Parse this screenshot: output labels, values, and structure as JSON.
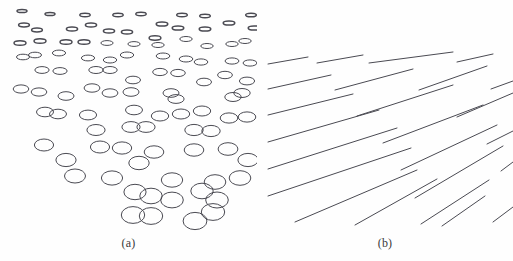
{
  "figure": {
    "background_color": "#fefefe",
    "stroke_color": "#4a4a52",
    "caption_color": "#3a3a3a",
    "width": 513,
    "height": 261
  },
  "panels": [
    {
      "id": "a",
      "caption": "(a)",
      "kind": "ellipse-texture-gradient",
      "description": "Field of small ellipses whose vertical compression decreases from top to bottom, producing a texture depth gradient."
    },
    {
      "id": "b",
      "caption": "(b)",
      "kind": "line-orientation-gradient",
      "description": "Field of parallel straight line segments whose slope steepens from upper-left to lower-right."
    }
  ],
  "chart_data": {
    "type": "scatter",
    "title": "",
    "xlabel": "",
    "ylabel": "",
    "panel_a": {
      "type": "scatter",
      "marker": "ellipse-outline",
      "xlim": [
        0,
        257
      ],
      "ylim": [
        0,
        235
      ],
      "grid": false,
      "legend": null,
      "note": "x, y are pixel centers; rx, ry are ellipse radii in px; flatness decreases with y",
      "fields": [
        "x",
        "y",
        "rx",
        "ry"
      ],
      "points": [
        [
          22,
          11,
          5.0,
          1.6
        ],
        [
          50,
          14,
          5.0,
          1.6
        ],
        [
          85,
          15,
          5.2,
          1.7
        ],
        [
          118,
          15,
          5.2,
          1.7
        ],
        [
          141,
          14,
          5.2,
          1.7
        ],
        [
          182,
          15,
          5.3,
          1.7
        ],
        [
          205,
          16,
          5.3,
          1.7
        ],
        [
          251,
          15,
          5.3,
          1.8
        ],
        [
          24,
          25,
          5.4,
          1.9
        ],
        [
          37,
          30,
          5.4,
          1.9
        ],
        [
          72,
          29,
          5.6,
          2.0
        ],
        [
          91,
          25,
          5.6,
          2.0
        ],
        [
          109,
          31,
          5.6,
          2.0
        ],
        [
          127,
          32,
          5.6,
          2.0
        ],
        [
          162,
          24,
          5.8,
          2.1
        ],
        [
          178,
          28,
          5.8,
          2.1
        ],
        [
          205,
          29,
          5.8,
          2.1
        ],
        [
          229,
          23,
          5.8,
          2.1
        ],
        [
          254,
          28,
          5.8,
          2.1
        ],
        [
          40,
          41,
          6.0,
          2.3
        ],
        [
          66,
          42,
          6.0,
          2.3
        ],
        [
          84,
          42,
          6.0,
          2.3
        ],
        [
          107,
          43,
          6.1,
          2.4
        ],
        [
          134,
          44,
          6.1,
          2.4
        ],
        [
          158,
          45,
          6.2,
          2.5
        ],
        [
          186,
          39,
          6.2,
          2.5
        ],
        [
          207,
          46,
          6.2,
          2.5
        ],
        [
          232,
          44,
          6.2,
          2.5
        ],
        [
          245,
          41,
          6.2,
          2.5
        ],
        [
          23,
          57,
          6.5,
          2.8
        ],
        [
          35,
          55,
          6.5,
          2.8
        ],
        [
          59,
          53,
          6.6,
          2.9
        ],
        [
          88,
          58,
          6.6,
          2.9
        ],
        [
          110,
          60,
          6.7,
          3.0
        ],
        [
          127,
          55,
          6.7,
          3.0
        ],
        [
          163,
          56,
          6.8,
          3.0
        ],
        [
          186,
          59,
          6.8,
          3.0
        ],
        [
          201,
          62,
          6.8,
          3.1
        ],
        [
          232,
          61,
          6.9,
          3.1
        ],
        [
          42,
          70,
          7.1,
          3.4
        ],
        [
          60,
          71,
          7.1,
          3.4
        ],
        [
          96,
          70,
          7.2,
          3.5
        ],
        [
          110,
          70,
          7.2,
          3.5
        ],
        [
          160,
          72,
          7.3,
          3.6
        ],
        [
          178,
          73,
          7.3,
          3.6
        ],
        [
          225,
          75,
          7.4,
          3.7
        ],
        [
          133,
          80,
          7.5,
          3.8
        ],
        [
          204,
          82,
          7.5,
          3.8
        ],
        [
          247,
          81,
          7.6,
          3.9
        ],
        [
          21,
          89,
          7.8,
          4.1
        ],
        [
          39,
          92,
          7.8,
          4.1
        ],
        [
          92,
          88,
          7.9,
          4.2
        ],
        [
          110,
          93,
          7.9,
          4.2
        ],
        [
          131,
          92,
          8.0,
          4.3
        ],
        [
          171,
          93,
          8.0,
          4.3
        ],
        [
          176,
          99,
          8.1,
          4.4
        ],
        [
          233,
          97,
          8.2,
          4.5
        ],
        [
          242,
          93,
          8.2,
          4.5
        ],
        [
          134,
          110,
          8.5,
          4.8
        ],
        [
          45,
          112,
          8.5,
          4.8
        ],
        [
          58,
          114,
          8.5,
          4.8
        ],
        [
          88,
          115,
          8.6,
          4.9
        ],
        [
          160,
          116,
          8.7,
          5.0
        ],
        [
          181,
          114,
          8.7,
          5.0
        ],
        [
          202,
          111,
          8.7,
          5.0
        ],
        [
          229,
          118,
          8.8,
          5.1
        ],
        [
          247,
          117,
          8.8,
          5.1
        ],
        [
          131,
          127,
          9.1,
          5.4
        ],
        [
          146,
          127,
          9.1,
          5.4
        ],
        [
          194,
          130,
          9.2,
          5.6
        ],
        [
          211,
          131,
          9.2,
          5.6
        ],
        [
          44,
          145,
          9.6,
          6.0
        ],
        [
          100,
          147,
          9.6,
          6.0
        ],
        [
          122,
          148,
          9.7,
          6.1
        ],
        [
          154,
          152,
          9.8,
          6.2
        ],
        [
          194,
          150,
          9.8,
          6.2
        ],
        [
          228,
          149,
          9.9,
          6.3
        ],
        [
          66,
          160,
          10.1,
          6.6
        ],
        [
          139,
          163,
          10.2,
          6.7
        ],
        [
          75,
          176,
          10.5,
          7.0
        ],
        [
          112,
          178,
          10.6,
          7.1
        ],
        [
          172,
          180,
          10.7,
          7.2
        ],
        [
          215,
          182,
          10.8,
          7.3
        ],
        [
          240,
          178,
          10.8,
          7.3
        ],
        [
          135,
          192,
          11.1,
          7.7
        ],
        [
          151,
          196,
          11.2,
          7.8
        ],
        [
          172,
          200,
          11.3,
          7.9
        ],
        [
          202,
          191,
          11.2,
          7.8
        ],
        [
          217,
          200,
          11.3,
          8.0
        ],
        [
          133,
          215,
          11.7,
          8.4
        ],
        [
          151,
          216,
          11.7,
          8.4
        ],
        [
          195,
          221,
          11.9,
          8.6
        ],
        [
          213,
          212,
          11.7,
          8.4
        ],
        [
          96,
          130,
          9.1,
          5.5
        ],
        [
          66,
          96,
          8.0,
          4.3
        ],
        [
          250,
          63,
          6.9,
          3.1
        ],
        [
          20,
          43,
          6.0,
          2.3
        ],
        [
          155,
          38,
          5.9,
          2.2
        ],
        [
          248,
          160,
          10.1,
          6.6
        ]
      ]
    },
    "panel_b": {
      "type": "line",
      "xlim": [
        0,
        256
      ],
      "ylim": [
        0,
        235
      ],
      "grid": false,
      "legend": null,
      "note": "each segment given as [x1, y1, x2, y2] in panel-local pixels; slope steepens toward lower-right",
      "fields": [
        "x1",
        "y1",
        "x2",
        "y2"
      ],
      "segments": [
        [
          11,
          64,
          51,
          57
        ],
        [
          60,
          63,
          106,
          55
        ],
        [
          112,
          63,
          196,
          52
        ],
        [
          200,
          62,
          236,
          54
        ],
        [
          11,
          89,
          74,
          75
        ],
        [
          78,
          90,
          156,
          69
        ],
        [
          162,
          90,
          230,
          66
        ],
        [
          234,
          89,
          256,
          81
        ],
        [
          11,
          115,
          96,
          94
        ],
        [
          100,
          116,
          196,
          85
        ],
        [
          200,
          117,
          256,
          93
        ],
        [
          11,
          142,
          122,
          110
        ],
        [
          126,
          143,
          226,
          105
        ],
        [
          230,
          144,
          256,
          131
        ],
        [
          11,
          169,
          140,
          128
        ],
        [
          144,
          170,
          240,
          125
        ],
        [
          244,
          171,
          256,
          162
        ],
        [
          11,
          196,
          154,
          148
        ],
        [
          158,
          198,
          246,
          146
        ],
        [
          38,
          222,
          160,
          170
        ],
        [
          164,
          224,
          232,
          180
        ],
        [
          236,
          222,
          256,
          207
        ],
        [
          98,
          225,
          180,
          179
        ],
        [
          185,
          226,
          228,
          196
        ]
      ]
    }
  }
}
